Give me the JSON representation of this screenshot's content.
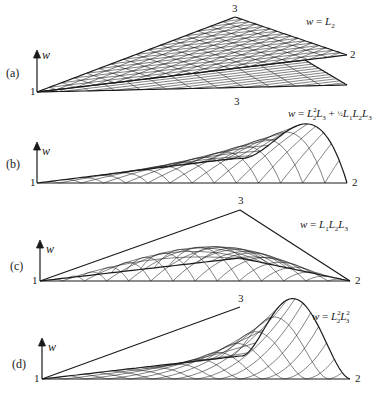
{
  "figure": {
    "panels": [
      {
        "id": "a",
        "label": "(a)",
        "equation": {
          "lhs": "w",
          "rhs_text": "w = L2",
          "terms": [
            "L",
            "2"
          ]
        },
        "axis_label": "w",
        "vertices": {
          "v1": "1",
          "v2": "2",
          "v3": "3"
        }
      },
      {
        "id": "b",
        "label": "(b)",
        "equation": {
          "lhs": "w",
          "rhs_text": "w = L2^2 L3 + 1/2 L1 L2 L3"
        },
        "axis_label": "w",
        "vertices": {
          "v1": "1",
          "v2": "2",
          "v3": "3"
        }
      },
      {
        "id": "c",
        "label": "(c)",
        "equation": {
          "lhs": "w",
          "rhs_text": "w = L1 L2 L3"
        },
        "axis_label": "w",
        "vertices": {
          "v1": "1",
          "v2": "2",
          "v3": "3"
        }
      },
      {
        "id": "d",
        "label": "(d)",
        "equation": {
          "lhs": "w",
          "rhs_text": "w = L2^2 L3^2"
        },
        "axis_label": "w",
        "vertices": {
          "v1": "1",
          "v2": "2",
          "v3": "3"
        }
      }
    ],
    "eq_parts": {
      "w": "w",
      "eq": " = ",
      "L": "L",
      "plus": " + ",
      "s1": "1",
      "s2": "2",
      "s3": "3",
      "half": "½"
    },
    "colors": {
      "ink": "#1a1a1a",
      "mesh": "#2a2a2a",
      "background": "#ffffff"
    }
  }
}
